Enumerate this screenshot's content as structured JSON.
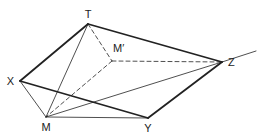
{
  "diagram": {
    "type": "geometric-figure",
    "line_color": "#222222",
    "background": "#ffffff",
    "points": [
      {
        "id": "T",
        "label": "T"
      },
      {
        "id": "M'",
        "label": "M′"
      },
      {
        "id": "X",
        "label": "X"
      },
      {
        "id": "Z",
        "label": "Z"
      },
      {
        "id": "M",
        "label": "M"
      },
      {
        "id": "Y",
        "label": "Y"
      }
    ],
    "segments": [
      {
        "from": "T",
        "to": "X",
        "style": "thick"
      },
      {
        "from": "T",
        "to": "Z",
        "style": "thick"
      },
      {
        "from": "X",
        "to": "Y",
        "style": "thick"
      },
      {
        "from": "Y",
        "to": "Z",
        "style": "thick"
      },
      {
        "from": "T",
        "to": "M",
        "style": "thin"
      },
      {
        "from": "M",
        "to": "X",
        "style": "thin"
      },
      {
        "from": "M",
        "to": "Y",
        "style": "thin"
      },
      {
        "from": "M",
        "to": "Z",
        "style": "thin"
      },
      {
        "from": "T",
        "to": "M'",
        "style": "dashed"
      },
      {
        "from": "M'",
        "to": "Z",
        "style": "dashed"
      },
      {
        "from": "M'",
        "to": "M",
        "style": "dashed"
      }
    ],
    "rays": [
      {
        "from": "Z",
        "direction": "extension",
        "style": "thin"
      }
    ]
  }
}
